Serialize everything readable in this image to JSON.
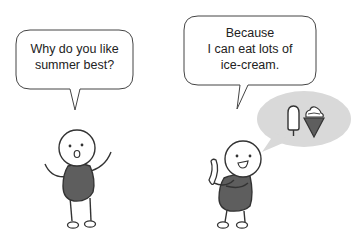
{
  "scene": {
    "description": "Two stick figures talking about summer",
    "colors": {
      "outline": "#333333",
      "body_fill": "#5e5e5e",
      "thought_bubble_fill": "#d9d9d9",
      "cone_fill": "#5e5e5e",
      "background": "#ffffff"
    }
  },
  "left_character": {
    "expression": "surprised",
    "speech": {
      "lines": [
        "Why do you like",
        "summer best?"
      ]
    }
  },
  "right_character": {
    "expression": "happy",
    "speech": {
      "lines": [
        "Because",
        "I can eat lots of",
        "ice-cream."
      ]
    },
    "thought": {
      "icons": [
        "popsicle-icon",
        "ice-cream-cone-icon"
      ]
    }
  }
}
